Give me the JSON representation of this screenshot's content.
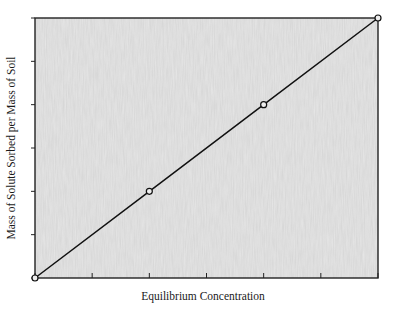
{
  "chart_data": {
    "type": "line",
    "title": "",
    "xlabel": "Equilibrium Concentration",
    "ylabel": "Mass of Solute Sorbed per Mass of Soil",
    "xlim": [
      0,
      6
    ],
    "ylim": [
      0,
      6
    ],
    "x_ticks": [
      0,
      1,
      2,
      3,
      4,
      5,
      6
    ],
    "y_ticks": [
      0,
      1,
      2,
      3,
      4,
      5,
      6
    ],
    "x_tick_labels": [],
    "y_tick_labels": [],
    "grid": false,
    "legend": null,
    "series": [
      {
        "name": "Linear sorption isotherm",
        "x": [
          0,
          2,
          4,
          6
        ],
        "y": [
          0,
          2,
          4,
          6
        ],
        "marker": "open-circle",
        "line": "solid"
      }
    ]
  },
  "colors": {
    "line": "#111111",
    "frame": "#222222",
    "plot_background": "#e4e4e4",
    "marker_fill": "#eeeeee"
  }
}
